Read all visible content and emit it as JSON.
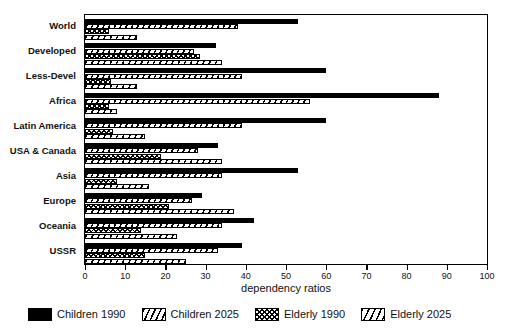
{
  "chart_data": {
    "type": "bar",
    "orientation": "horizontal",
    "title": "",
    "xlabel": "dependency ratios",
    "ylabel": "",
    "xlim": [
      0,
      100
    ],
    "xticks": [
      0,
      10,
      20,
      30,
      40,
      50,
      60,
      70,
      80,
      90,
      100
    ],
    "grid": false,
    "legend_position": "bottom",
    "categories": [
      "World",
      "Developed",
      "Less-Devel",
      "Africa",
      "Latin America",
      "USA & Canada",
      "Asia",
      "Europe",
      "Oceania",
      "USSR"
    ],
    "series": [
      {
        "name": "Children 1990",
        "fill": "solid-black",
        "values": [
          53,
          32.5,
          60,
          88,
          60,
          33,
          53,
          29,
          42,
          39
        ]
      },
      {
        "name": "Children 2025",
        "fill": "diagonal-hatch",
        "values": [
          38,
          27,
          39,
          56,
          39,
          28,
          34,
          26.5,
          34,
          33
        ]
      },
      {
        "name": "Elderly 1990",
        "fill": "crosshatch",
        "values": [
          6,
          28.5,
          6.5,
          6,
          7,
          19,
          8,
          21,
          14,
          15
        ]
      },
      {
        "name": "Elderly 2025",
        "fill": "diagonal-hatch-wide",
        "values": [
          13,
          34,
          13,
          8,
          15,
          34,
          16,
          37,
          23,
          25
        ]
      }
    ]
  },
  "legend": {
    "items": [
      {
        "label": "Children 1990"
      },
      {
        "label": "Children 2025"
      },
      {
        "label": "Elderly 1990"
      },
      {
        "label": "Elderly 2025"
      }
    ]
  },
  "axis": {
    "x_title": "dependency ratios"
  }
}
